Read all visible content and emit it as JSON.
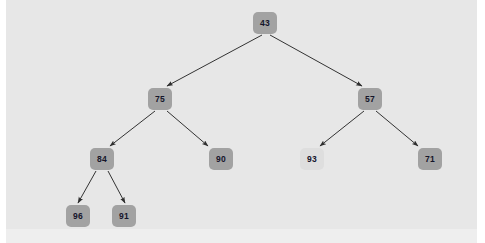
{
  "diagram": {
    "background_color": "#e7e7e7",
    "page_color": "#ffffff",
    "node_color": "#a2a2a2",
    "node_faded_color": "#dedede",
    "text_color": "#15152a",
    "edge_color": "#333333",
    "nodes": [
      {
        "id": "n0",
        "label": "43",
        "x": 253,
        "y": 12,
        "faded": false
      },
      {
        "id": "n1",
        "label": "75",
        "x": 148,
        "y": 88,
        "faded": false
      },
      {
        "id": "n2",
        "label": "57",
        "x": 358,
        "y": 88,
        "faded": false
      },
      {
        "id": "n3",
        "label": "84",
        "x": 90,
        "y": 148,
        "faded": false
      },
      {
        "id": "n4",
        "label": "90",
        "x": 209,
        "y": 148,
        "faded": false
      },
      {
        "id": "n5",
        "label": "93",
        "x": 300,
        "y": 148,
        "faded": true
      },
      {
        "id": "n6",
        "label": "71",
        "x": 418,
        "y": 148,
        "faded": false
      },
      {
        "id": "n7",
        "label": "96",
        "x": 66,
        "y": 205,
        "faded": false
      },
      {
        "id": "n8",
        "label": "91",
        "x": 112,
        "y": 205,
        "faded": false
      }
    ],
    "edges": [
      {
        "from": "43",
        "to": "75",
        "x1": 262,
        "y1": 35,
        "x2": 167,
        "y2": 86
      },
      {
        "from": "43",
        "to": "57",
        "x1": 270,
        "y1": 35,
        "x2": 362,
        "y2": 86
      },
      {
        "from": "75",
        "to": "84",
        "x1": 155,
        "y1": 111,
        "x2": 110,
        "y2": 146
      },
      {
        "from": "75",
        "to": "90",
        "x1": 167,
        "y1": 111,
        "x2": 208,
        "y2": 146
      },
      {
        "from": "84",
        "to": "96",
        "x1": 96,
        "y1": 171,
        "x2": 78,
        "y2": 203
      },
      {
        "from": "84",
        "to": "91",
        "x1": 108,
        "y1": 171,
        "x2": 125,
        "y2": 203
      },
      {
        "from": "57",
        "to": "93",
        "x1": 364,
        "y1": 111,
        "x2": 320,
        "y2": 146
      },
      {
        "from": "57",
        "to": "71",
        "x1": 376,
        "y1": 111,
        "x2": 418,
        "y2": 146
      }
    ]
  }
}
